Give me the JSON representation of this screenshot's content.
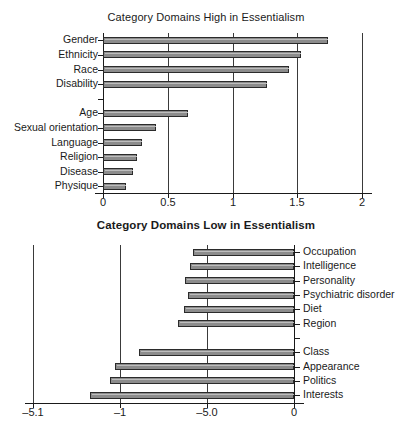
{
  "figure": {
    "background": "#ffffff",
    "bar_fill": "#8c8c8c",
    "bar_stroke": "#2b2b2b"
  },
  "chart_data": [
    {
      "type": "bar",
      "orientation": "horizontal",
      "title": "Category Domains High in Essentialism",
      "xlabel": "",
      "ylabel": "",
      "xlim": [
        0,
        2
      ],
      "xticks": [
        "0",
        "0.5",
        "1",
        "1.5",
        "2"
      ],
      "xtick_values": [
        0,
        0.5,
        1,
        1.5,
        2
      ],
      "grid": true,
      "legend": "none",
      "categories": [
        "Gender",
        "Ethnicity",
        "Race",
        "Disability",
        "",
        "Age",
        "Sexual orientation",
        "Language",
        "Religion",
        "Disease",
        "Physique"
      ],
      "values": [
        1.74,
        1.53,
        1.44,
        1.27,
        null,
        0.66,
        0.41,
        0.3,
        0.26,
        0.23,
        0.18
      ]
    },
    {
      "type": "bar",
      "orientation": "horizontal",
      "title": "Category Domains Low in Essentialism",
      "xlabel": "",
      "ylabel": "",
      "xlim": [
        -3,
        0
      ],
      "xticks": [
        "–5.1",
        "–1",
        "–5.0",
        "0"
      ],
      "xtick_values": [
        -3,
        -2,
        -1,
        0
      ],
      "grid": true,
      "legend": "none",
      "labels_position": "right",
      "categories": [
        "Occupation",
        "Intelligence",
        "Personality",
        "Psychiatric disorder",
        "Diet",
        "Region",
        "",
        "Class",
        "Appearance",
        "Politics",
        "Interests"
      ],
      "values": [
        -1.16,
        -1.2,
        -1.25,
        -1.22,
        -1.27,
        -1.33,
        null,
        -1.78,
        -2.06,
        -2.12,
        -2.35
      ]
    }
  ]
}
